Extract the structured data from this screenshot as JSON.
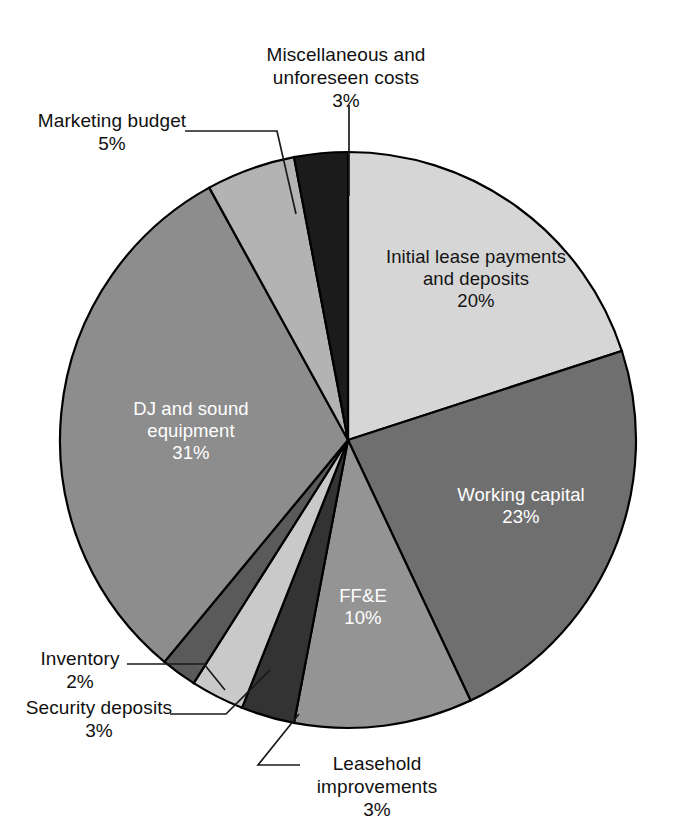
{
  "figure": {
    "background_color": "#ffffff",
    "width": 673,
    "height": 840
  },
  "chart_data": {
    "type": "pie",
    "title": "",
    "subtitle": "",
    "xlabel": "",
    "ylabel": "",
    "legend_position": "none",
    "grid": false,
    "label_format": "name + percent",
    "start_angle_deg": 0,
    "direction": "clockwise",
    "units": "percent",
    "total": 100,
    "categories": [
      "Initial lease payments and deposits",
      "Working capital",
      "FF&E",
      "Leasehold improvements",
      "Security deposits",
      "Inventory",
      "DJ and sound equipment",
      "Marketing budget",
      "Miscellaneous and unforeseen costs"
    ],
    "values": [
      20,
      23,
      10,
      3,
      3,
      2,
      31,
      5,
      3
    ],
    "colors": [
      "#d6d6d6",
      "#6f6f6f",
      "#949494",
      "#333333",
      "#c9c9c9",
      "#5a5a5a",
      "#8d8d8d",
      "#b3b3b3",
      "#1b1b1b"
    ],
    "slices": [
      {
        "name": "Initial lease payments and deposits",
        "value": 20,
        "percent_label": "20%",
        "color": "#d6d6d6",
        "label_placement": "inside",
        "text_color": "#141414"
      },
      {
        "name": "Working capital",
        "value": 23,
        "percent_label": "23%",
        "color": "#6f6f6f",
        "label_placement": "inside",
        "text_color": "#ffffff"
      },
      {
        "name": "FF&E",
        "value": 10,
        "percent_label": "10%",
        "color": "#949494",
        "label_placement": "inside",
        "text_color": "#ffffff"
      },
      {
        "name": "Leasehold improvements",
        "value": 3,
        "percent_label": "3%",
        "color": "#333333",
        "label_placement": "outside",
        "text_color": "#111111"
      },
      {
        "name": "Security deposits",
        "value": 3,
        "percent_label": "3%",
        "color": "#c9c9c9",
        "label_placement": "outside",
        "text_color": "#111111"
      },
      {
        "name": "Inventory",
        "value": 2,
        "percent_label": "2%",
        "color": "#5a5a5a",
        "label_placement": "outside",
        "text_color": "#111111"
      },
      {
        "name": "DJ and sound equipment",
        "value": 31,
        "percent_label": "31%",
        "color": "#8d8d8d",
        "label_placement": "inside",
        "text_color": "#ffffff"
      },
      {
        "name": "Marketing budget",
        "value": 5,
        "percent_label": "5%",
        "color": "#b3b3b3",
        "label_placement": "outside",
        "text_color": "#111111"
      },
      {
        "name": "Miscellaneous and unforeseen costs",
        "value": 3,
        "percent_label": "3%",
        "color": "#1b1b1b",
        "label_placement": "outside",
        "text_color": "#111111"
      }
    ]
  },
  "labels": {
    "initial_lease": "Initial lease payments\nand deposits\n20%",
    "working_capital": "Working capital\n23%",
    "ffe": "FF&E\n10%",
    "dj_sound": "DJ and sound\nequipment\n31%",
    "miscellaneous": "Miscellaneous and\nunforeseen costs\n3%",
    "marketing": "Marketing budget\n5%",
    "inventory": "Inventory\n2%",
    "security_deposits": "Security deposits\n3%",
    "leasehold": "Leasehold\nimprovements\n3%"
  },
  "geometry": {
    "center_x": 348,
    "center_y": 440,
    "radius": 288,
    "outline_color": "#000000"
  }
}
